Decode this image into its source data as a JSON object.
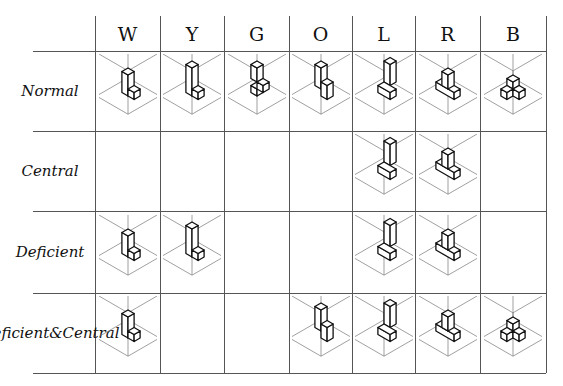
{
  "figure": {
    "cropped_title": "",
    "columns": [
      "W",
      "Y",
      "G",
      "O",
      "L",
      "R",
      "B"
    ],
    "rows": [
      {
        "label": "Normal",
        "cells": [
          "L-shape",
          "tall-L",
          "notched",
          "step-Z",
          "post-with-block",
          "post-on-slab",
          "tri-cube-stack"
        ]
      },
      {
        "label": "Central",
        "cells": [
          "",
          "",
          "",
          "",
          "post-with-block",
          "post-on-slab",
          ""
        ]
      },
      {
        "label": "Deficient",
        "cells": [
          "L-shape",
          "tall-L",
          "",
          "",
          "post-with-block",
          "post-on-slab",
          ""
        ]
      },
      {
        "label": "Deficient & Central",
        "label_lines": [
          "Deficient",
          "&",
          "Central"
        ],
        "cells": [
          "L-shape",
          "",
          "",
          "step-Z",
          "post-with-block",
          "post-on-slab",
          "tri-cube-stack"
        ]
      }
    ]
  },
  "style": {
    "line_color": "#555555",
    "ink_color": "#111111",
    "box_color": "#777777"
  }
}
